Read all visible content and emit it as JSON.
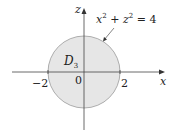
{
  "diagram": {
    "type": "region-in-plane",
    "axes": {
      "horizontal": {
        "label": "x"
      },
      "vertical": {
        "label": "z"
      },
      "origin_label": "0"
    },
    "ticks": {
      "neg": "−2",
      "pos": "2"
    },
    "region": {
      "label_main": "D",
      "label_sub": "3",
      "fill": "#e6e6e6",
      "stroke": "#a0a0a0"
    },
    "equation": {
      "x": "x",
      "exp1": "2",
      "plus": " + ",
      "z": "z",
      "exp2": "2",
      "eq": " = 4"
    }
  }
}
